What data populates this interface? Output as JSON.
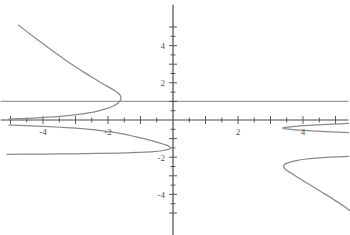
{
  "chart_data": {
    "type": "line",
    "title": "",
    "subtitle": "",
    "xlabel": "",
    "ylabel": "",
    "xlim": [
      -5.3,
      5.4
    ],
    "ylim": [
      -6.2,
      6.2
    ],
    "grid": false,
    "legend": null,
    "background_color": "#ffffff",
    "axis_color": "#4a4a4a",
    "curve_color": "#8a8a8a",
    "asymptote_color": "#9a9a9a",
    "tick_label_color": "#555555",
    "x_axis": {
      "labeled_ticks": [
        -4,
        -2,
        2,
        4
      ],
      "labeled_tick_text": [
        "-4",
        "-2",
        "2",
        "4"
      ],
      "minor_tick_step": 0.5,
      "major_tick_step": 1,
      "axis_value": 0
    },
    "y_axis": {
      "labeled_ticks": [
        4,
        2,
        -2,
        -4
      ],
      "labeled_tick_text": [
        "4",
        "2",
        "-2",
        "-4"
      ],
      "minor_tick_step": 0.5,
      "major_tick_step": 1,
      "axis_value": 0
    },
    "annotations": [
      {
        "name": "horizontal-asymptote",
        "kind": "horizontal-line",
        "y": 1.0,
        "x_from": -5.3,
        "x_to": 5.4,
        "color": "#9a9a9a"
      }
    ],
    "series": [
      {
        "name": "upper-left-branch",
        "description": "branch rising to upper-left, turning point near x = -1.6",
        "points": [
          [
            -4.75,
            5.1
          ],
          [
            -4.4,
            4.62
          ],
          [
            -4.05,
            4.16
          ],
          [
            -3.7,
            3.71
          ],
          [
            -3.35,
            3.27
          ],
          [
            -3.0,
            2.86
          ],
          [
            -2.7,
            2.52
          ],
          [
            -2.4,
            2.2
          ],
          [
            -2.15,
            1.94
          ],
          [
            -1.95,
            1.74
          ],
          [
            -1.8,
            1.58
          ],
          [
            -1.7,
            1.46
          ],
          [
            -1.63,
            1.34
          ],
          [
            -1.6,
            1.2
          ],
          [
            -1.62,
            1.06
          ],
          [
            -1.7,
            0.9
          ],
          [
            -1.85,
            0.74
          ],
          [
            -2.1,
            0.58
          ],
          [
            -2.45,
            0.42
          ],
          [
            -2.9,
            0.3
          ],
          [
            -3.45,
            0.2
          ],
          [
            -4.05,
            0.13
          ],
          [
            -4.6,
            0.08
          ],
          [
            -5.05,
            0.05
          ]
        ]
      },
      {
        "name": "lower-left-branch",
        "description": "narrow loop below axis with rightmost vertex near the y-axis",
        "points": [
          [
            -5.05,
            -0.27
          ],
          [
            -4.55,
            -0.3
          ],
          [
            -4.0,
            -0.34
          ],
          [
            -3.45,
            -0.39
          ],
          [
            -2.9,
            -0.45
          ],
          [
            -2.4,
            -0.53
          ],
          [
            -1.95,
            -0.63
          ],
          [
            -1.55,
            -0.75
          ],
          [
            -1.2,
            -0.88
          ],
          [
            -0.9,
            -1.0
          ],
          [
            -0.62,
            -1.12
          ],
          [
            -0.4,
            -1.24
          ],
          [
            -0.22,
            -1.34
          ],
          [
            -0.12,
            -1.42
          ],
          [
            -0.08,
            -1.5
          ],
          [
            -0.14,
            -1.58
          ],
          [
            -0.3,
            -1.64
          ],
          [
            -0.6,
            -1.7
          ],
          [
            -1.05,
            -1.74
          ],
          [
            -1.65,
            -1.78
          ],
          [
            -2.35,
            -1.8
          ],
          [
            -3.1,
            -1.82
          ],
          [
            -3.9,
            -1.83
          ],
          [
            -4.65,
            -1.84
          ],
          [
            -5.1,
            -1.85
          ]
        ]
      },
      {
        "name": "right-cusp-branch",
        "description": "thin wedge opening rightward with vertex near x = 3.4, y = -0.4",
        "points": [
          [
            5.4,
            -0.18
          ],
          [
            4.9,
            -0.22
          ],
          [
            4.45,
            -0.26
          ],
          [
            4.05,
            -0.3
          ],
          [
            3.75,
            -0.34
          ],
          [
            3.55,
            -0.38
          ],
          [
            3.42,
            -0.41
          ],
          [
            3.38,
            -0.44
          ],
          [
            3.48,
            -0.48
          ],
          [
            3.7,
            -0.52
          ],
          [
            4.0,
            -0.56
          ],
          [
            4.4,
            -0.6
          ],
          [
            4.85,
            -0.64
          ],
          [
            5.4,
            -0.68
          ]
        ]
      },
      {
        "name": "lower-right-branch",
        "description": "branch opening rightward, leftmost vertex near x = 3.4, y = -2.45",
        "points": [
          [
            5.4,
            -1.96
          ],
          [
            4.85,
            -2.0
          ],
          [
            4.4,
            -2.05
          ],
          [
            4.05,
            -2.11
          ],
          [
            3.8,
            -2.18
          ],
          [
            3.6,
            -2.26
          ],
          [
            3.46,
            -2.36
          ],
          [
            3.4,
            -2.48
          ],
          [
            3.44,
            -2.62
          ],
          [
            3.58,
            -2.8
          ],
          [
            3.78,
            -3.02
          ],
          [
            4.02,
            -3.28
          ],
          [
            4.3,
            -3.58
          ],
          [
            4.62,
            -3.92
          ],
          [
            4.95,
            -4.28
          ],
          [
            5.28,
            -4.66
          ],
          [
            5.45,
            -4.88
          ]
        ]
      }
    ]
  }
}
